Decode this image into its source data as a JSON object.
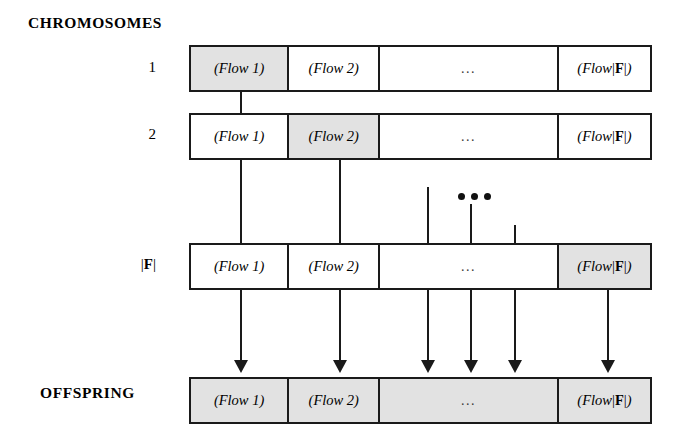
{
  "headings": {
    "chromosomes": "CHROMOSOMES",
    "offspring": "OFFSPRING"
  },
  "row_labels": {
    "row1": "1",
    "row2": "2",
    "row3_prefix": "|",
    "row3_f": "F",
    "row3_suffix": "|"
  },
  "cells": {
    "flow1": "(Flow 1)",
    "flow2": "(Flow 2)",
    "ellipsis": "...",
    "flowF_open": "(Flow ",
    "flowF_bar_left": "|",
    "flowF_f": "F",
    "flowF_bar_right": "|",
    "flowF_close": ")"
  },
  "rows": [
    {
      "name": "chromosome-1",
      "label": "1",
      "shaded": [
        true,
        false,
        false,
        false
      ]
    },
    {
      "name": "chromosome-2",
      "label": "2",
      "shaded": [
        false,
        true,
        false,
        false
      ]
    },
    {
      "name": "chromosome-F",
      "label": "|F|",
      "shaded": [
        false,
        false,
        false,
        true
      ]
    },
    {
      "name": "offspring",
      "label": "OFFSPRING",
      "shaded": [
        true,
        true,
        true,
        true
      ]
    }
  ],
  "arrows": {
    "count": 6,
    "tip_positions": [
      241,
      340,
      428,
      471,
      515,
      608
    ]
  },
  "colors": {
    "shade": "#e2e2e2",
    "line": "#1a1a1a",
    "background": "#ffffff"
  }
}
